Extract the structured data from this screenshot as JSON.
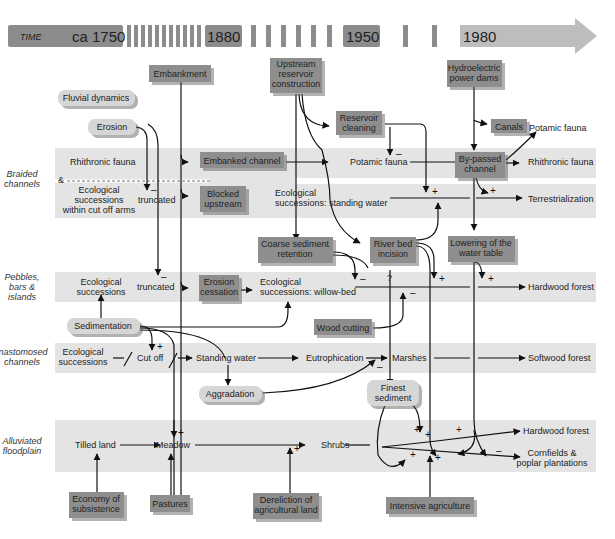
{
  "timeline": {
    "label": "TIME",
    "years": [
      "ca 1750",
      "1880",
      "1950",
      "1980"
    ]
  },
  "rows": [
    {
      "id": "braided",
      "label_lines": [
        "Braided",
        "channels"
      ]
    },
    {
      "id": "pebbles",
      "label_lines": [
        "Pebbles,",
        "bars &",
        "islands"
      ]
    },
    {
      "id": "anastomosed",
      "label_lines": [
        "Anastomosed",
        "channels"
      ]
    },
    {
      "id": "floodplain",
      "label_lines": [
        "Alluviated",
        "floodplain"
      ]
    }
  ],
  "drivers": {
    "embankment": "Embankment",
    "upstream_reservoir": [
      "Upstream",
      "reservoir",
      "construction"
    ],
    "hydroelectric": [
      "Hydroelectric",
      "power dams"
    ],
    "reservoir_cleaning": [
      "Reservoir",
      "cleaning"
    ],
    "canals": "Canals",
    "embanked_channel": "Embanked channel",
    "blocked_upstream": [
      "Blocked",
      "upstream"
    ],
    "bypassed_channel": [
      "By-passed",
      "channel"
    ],
    "coarse_sediment": [
      "Coarse sediment",
      "retention"
    ],
    "river_bed_incision": [
      "River bed",
      "incision"
    ],
    "lowering_water_table": [
      "Lowering of the",
      "water table"
    ],
    "erosion_cessation": [
      "Erosion",
      "cessation"
    ],
    "wood_cutting": "Wood cutting",
    "economy_subsistence": [
      "Economy of",
      "subsistence"
    ],
    "pastures": "Pastures",
    "dereliction": [
      "Dereliction of",
      "agricultural land"
    ],
    "intensive_agriculture": "Intensive agriculture"
  },
  "processes": {
    "fluvial_dynamics": "Fluvial dynamics",
    "erosion": "Erosion",
    "sedimentation": "Sedimentation",
    "aggradation": "Aggradation",
    "finest_sediment": [
      "Finest",
      "sediment"
    ]
  },
  "states": {
    "rhithronic_fauna_1": "Rhithronic fauna",
    "ampersand": "&",
    "eco_cutoff_arms": [
      "Ecological",
      "successions",
      "within cut off arms"
    ],
    "truncated_1": "truncated",
    "potamic_fauna_1": "Potamic fauna",
    "potamic_fauna_2": "Potamic fauna",
    "rhithronic_fauna_2": "Rhithronic fauna",
    "eco_standing_water": [
      "Ecological",
      "successions: standing water"
    ],
    "terrestrialization": "Terrestrialization",
    "eco_pebbles": [
      "Ecological",
      "successions"
    ],
    "truncated_2": "truncated",
    "eco_willow": [
      "Ecological",
      "successions: willow-bed"
    ],
    "question": "?",
    "hardwood_forest_1": "Hardwood forest",
    "eco_anastomosed": [
      "Ecological",
      "successions"
    ],
    "cut_off": "Cut off",
    "standing_water": "Standing water",
    "eutrophication": "Eutrophication",
    "marshes": "Marshes",
    "softwood_forest": "Softwood forest",
    "tilled_land": "Tilled land",
    "meadow": "Meadow",
    "shrubs": "Shrubs",
    "hardwood_forest_2": "Hardwood forest",
    "cornfields": [
      "Cornfields &",
      "poplar plantations"
    ]
  },
  "signs": {
    "plus": "+",
    "minus": "–"
  }
}
